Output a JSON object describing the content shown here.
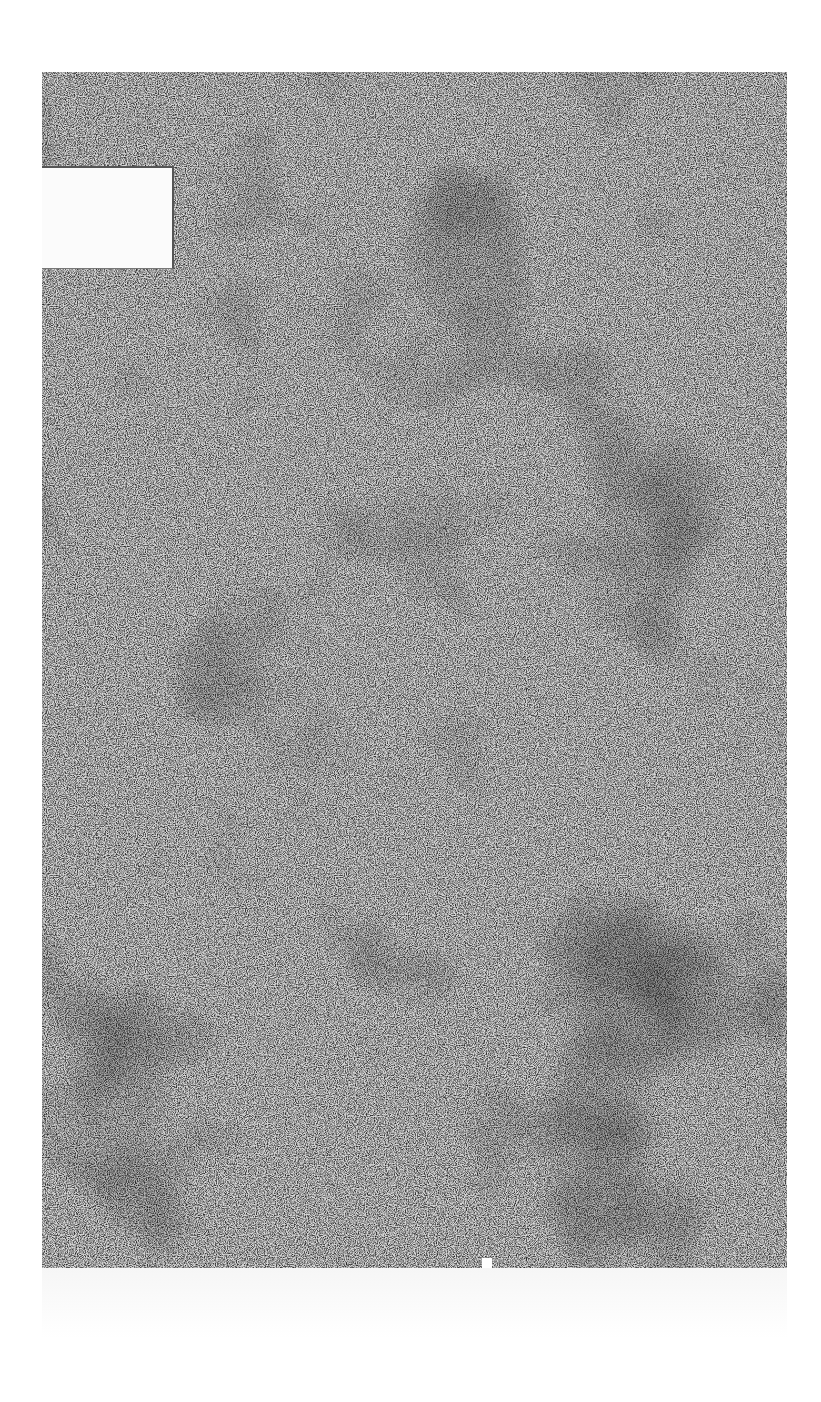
{
  "document": {
    "type": "scanned-page",
    "description": "Speckled / marbled paper texture with a blank label patch",
    "label_text": "",
    "colors": {
      "paper": "#8a8a8a",
      "label": "#fbfbfb",
      "background": "#ffffff"
    }
  }
}
